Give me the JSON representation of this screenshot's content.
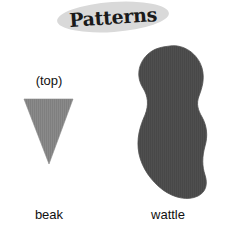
{
  "canvas": {
    "width": 225,
    "height": 241,
    "background": "#ffffff"
  },
  "title": {
    "text": "Patterns",
    "badge_color": "#d9d9d9",
    "text_color": "#1a1a1a"
  },
  "shapes": [
    {
      "id": "beak",
      "label": "beak",
      "annotation": "(top)",
      "icon_name": "downward-triangle-shape",
      "fill": "#888888",
      "form": "inverted triangle"
    },
    {
      "id": "wattle",
      "label": "wattle",
      "annotation": "",
      "icon_name": "lobed-blob-shape",
      "fill": "#4d4d4d",
      "form": "three-lobed blob"
    }
  ],
  "labels": {
    "beak_top": "(top)",
    "beak": "beak",
    "wattle": "wattle"
  }
}
